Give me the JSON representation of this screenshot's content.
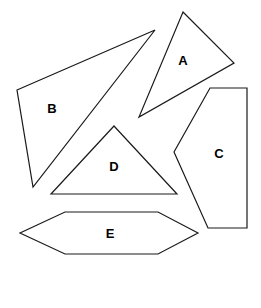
{
  "figure": {
    "width": 261,
    "height": 308,
    "background_color": "#ffffff",
    "stroke_color": "#1a1a1a",
    "fill_color": "#ffffff",
    "label_color": "#000000"
  },
  "shapes": [
    {
      "id": "shape-a",
      "label": "A",
      "kind": "triangle",
      "points": "183,12 234,63 139,117",
      "label_x": 183,
      "label_y": 62
    },
    {
      "id": "shape-b",
      "label": "B",
      "kind": "triangle",
      "points": "17,90 155,30 33,187",
      "label_x": 52,
      "label_y": 110
    },
    {
      "id": "shape-c",
      "label": "C",
      "kind": "pentagon",
      "points": "210,88 247,88 247,228 208,228 174,152",
      "label_x": 219,
      "label_y": 155
    },
    {
      "id": "shape-d",
      "label": "D",
      "kind": "triangle",
      "points": "114,126 177,194 51,194",
      "label_x": 114,
      "label_y": 168
    },
    {
      "id": "shape-e",
      "label": "E",
      "kind": "hexagon",
      "points": "65,212 158,212 198,233 158,254 65,254 20,233",
      "label_x": 110,
      "label_y": 235
    }
  ]
}
